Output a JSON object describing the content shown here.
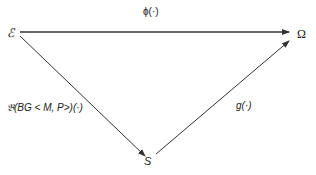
{
  "diagram": {
    "type": "commutative-triangle",
    "nodes": {
      "source": "ℰ",
      "target": "Ω",
      "middle": "S"
    },
    "edges": {
      "top": {
        "from": "ℰ",
        "to": "Ω",
        "label": "ϕ(·)"
      },
      "left": {
        "from": "ℰ",
        "to": "S",
        "label": "𝔅(BG < M, P>)(·)"
      },
      "right": {
        "from": "S",
        "to": "Ω",
        "label": "g(·)"
      }
    },
    "colors": {
      "line": "#333333",
      "text": "#222222",
      "background": "#ffffff"
    }
  }
}
